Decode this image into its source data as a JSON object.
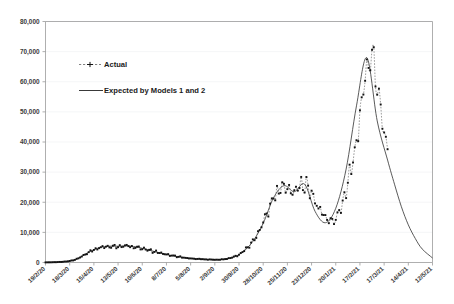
{
  "chart_data": {
    "type": "line",
    "title": "",
    "subtitle": "",
    "xlabel": "",
    "ylabel": "",
    "ylim": [
      0,
      80000
    ],
    "ytick_labels": [
      "0",
      "10,000",
      "20,000",
      "30,000",
      "40,000",
      "50,000",
      "60,000",
      "70,000",
      "80,000"
    ],
    "ytick_values": [
      0,
      10000,
      20000,
      30000,
      40000,
      50000,
      60000,
      70000,
      80000
    ],
    "xtick_labels": [
      "19/2/20",
      "18/3/20",
      "15/4/20",
      "13/5/20",
      "10/6/20",
      "8/7/20",
      "5/8/20",
      "2/9/20",
      "30/9/20",
      "28/10/20",
      "25/11/20",
      "23/12/20",
      "20/1/21",
      "17/2/21",
      "17/3/21",
      "14/4/21",
      "12/5/21"
    ],
    "xtick_indices": [
      0,
      28,
      56,
      84,
      112,
      140,
      168,
      196,
      224,
      252,
      280,
      308,
      336,
      364,
      392,
      420,
      448
    ],
    "x_start_date": "19/2/20",
    "x_end_date": "12/5/21",
    "n_points": 449,
    "grid": true,
    "legend_position": "inside-top-left",
    "legend": [
      {
        "name": "Actual",
        "style": "dashed-with-markers",
        "color": "#131313"
      },
      {
        "name": "Expected by Models 1 and 2",
        "style": "solid-line",
        "color": "#3c3c3c"
      }
    ],
    "series": [
      {
        "name": "Actual",
        "style": "dashed-with-markers",
        "note": "daily observed counts, ends before the forecast tail",
        "x": [
          0,
          6,
          12,
          18,
          24,
          30,
          36,
          42,
          48,
          54,
          60,
          66,
          72,
          78,
          84,
          90,
          96,
          102,
          108,
          114,
          120,
          126,
          132,
          138,
          144,
          150,
          156,
          162,
          168,
          174,
          180,
          186,
          192,
          198,
          204,
          210,
          216,
          222,
          228,
          234,
          240,
          246,
          252,
          258,
          264,
          270,
          276,
          282,
          288,
          294,
          300,
          306,
          312,
          318,
          324,
          330,
          336,
          342,
          348,
          354,
          360,
          366,
          372,
          378,
          384,
          390,
          396
        ],
        "values": [
          40,
          60,
          110,
          190,
          330,
          600,
          1100,
          2000,
          3100,
          4000,
          4700,
          5200,
          5400,
          5500,
          5400,
          5300,
          5500,
          5200,
          5000,
          4600,
          4100,
          3600,
          3200,
          2800,
          2400,
          2100,
          1800,
          1550,
          1350,
          1200,
          1100,
          1000,
          950,
          920,
          980,
          1200,
          1600,
          2300,
          3400,
          5000,
          7000,
          9500,
          13000,
          17000,
          21500,
          24000,
          25500,
          24500,
          23500,
          24500,
          26000,
          24000,
          20500,
          17000,
          14500,
          13200,
          14500,
          18000,
          24000,
          31000,
          40000,
          52000,
          63000,
          68500,
          60000,
          47000,
          38000
        ]
      },
      {
        "name": "Expected by Models 1 and 2",
        "style": "solid-line",
        "note": "smooth fitted curve continuing as forecast decay to the right edge",
        "x": [
          0,
          12,
          24,
          36,
          48,
          60,
          72,
          84,
          96,
          108,
          120,
          132,
          144,
          156,
          168,
          180,
          192,
          204,
          216,
          228,
          240,
          252,
          264,
          276,
          288,
          300,
          312,
          324,
          336,
          348,
          360,
          372,
          384,
          396,
          404,
          412,
          420,
          428,
          436,
          448
        ],
        "values": [
          40,
          110,
          330,
          1100,
          3100,
          4700,
          5400,
          5400,
          5500,
          5000,
          4100,
          3200,
          2400,
          1800,
          1350,
          1100,
          950,
          980,
          1600,
          3400,
          7000,
          13000,
          21500,
          25500,
          23500,
          26000,
          17000,
          13200,
          18000,
          31000,
          52000,
          68000,
          47000,
          34000,
          26000,
          18500,
          12500,
          8000,
          4500,
          1500
        ]
      }
    ],
    "peak_annotation": {
      "peak_value": 68500,
      "peak_label_approx": "just under 70,000"
    }
  },
  "legend": {
    "actual_label": "Actual",
    "expected_label": "Expected by Models 1 and 2"
  }
}
